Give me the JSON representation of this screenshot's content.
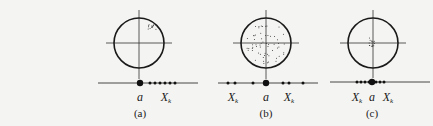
{
  "figure": {
    "panels": [
      {
        "id": "a",
        "caption": "(a)",
        "label_a": "a",
        "label_xk": "X",
        "label_xk_sub": "k",
        "description": "Target with tight cluster offset to upper-right; measured values X_k all on one side of true value a",
        "target": {
          "cx": 139,
          "cy": 43,
          "r": 25
        },
        "cluster": {
          "type": "tight-offset",
          "cx": 152,
          "cy": 27
        },
        "number_line": {
          "y": 83,
          "x1": 98,
          "x2": 198,
          "true_value_x": 140,
          "points_x": [
            150,
            155,
            160,
            165,
            170,
            175
          ]
        }
      },
      {
        "id": "b",
        "caption": "(b)",
        "label_a": "a",
        "label_xk": "X",
        "label_xk_sub": "k",
        "description": "Target with widely scattered points centered on target; measured values X_k spread on both sides of a",
        "target": {
          "cx": 266,
          "cy": 43,
          "r": 25
        },
        "cluster": {
          "type": "wide-centered"
        },
        "number_line": {
          "y": 83,
          "x1": 218,
          "x2": 318,
          "true_value_x": 266,
          "points_x": [
            228,
            235,
            253,
            283,
            289,
            303
          ]
        }
      },
      {
        "id": "c",
        "caption": "(c)",
        "label_a": "a",
        "label_xk": "X",
        "label_xk_sub": "k",
        "description": "Target with tight cluster at center; measured values X_k closely around a",
        "target": {
          "cx": 373,
          "cy": 43,
          "r": 25
        },
        "cluster": {
          "type": "tight-centered",
          "cx": 372,
          "cy": 42
        },
        "number_line": {
          "y": 82,
          "x1": 330,
          "x2": 430,
          "true_value_x": 372,
          "points_x": [
            357,
            361,
            365,
            369,
            376,
            380,
            384
          ]
        }
      }
    ]
  }
}
